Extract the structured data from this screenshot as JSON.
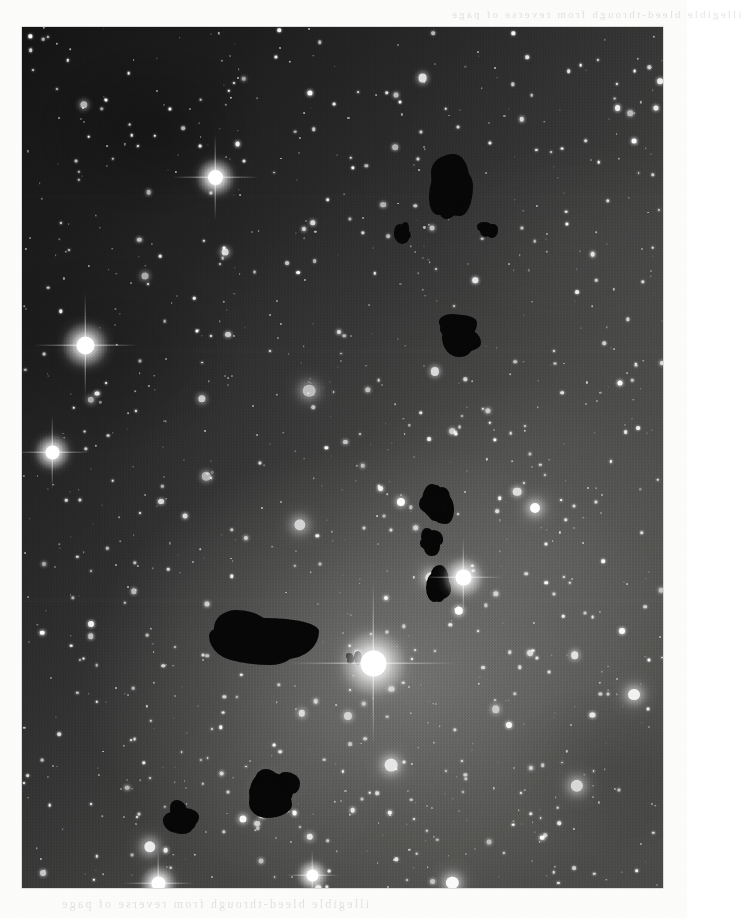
{
  "page": {
    "background_color": "#fcfcfa",
    "kind": "printed-photographic-plate"
  },
  "plate": {
    "name": "star-field-photograph",
    "x": 22,
    "y": 27,
    "width": 641,
    "height": 861,
    "subject": "Dense Milky Way star field with dark nebulae (Bok globules)",
    "sky_dark_color": "#141414",
    "sky_light_color": "#4e4e4c",
    "nebulosity_note": "Diffuse bright nebulosity surrounds the brightest star in the lower-right quadrant; the upper-left quadrant is the darkest part of the field."
  },
  "ghost_text": {
    "bottom": "illegible bleed-through from reverse of page",
    "top": "illegible bleed-through from reverse of page"
  },
  "chart_data": {
    "type": "scatter",
    "xlabel": "",
    "ylabel": "",
    "xlim": [
      0,
      641
    ],
    "ylim": [
      0,
      861
    ],
    "grid": false,
    "legend": null,
    "annotations": [
      "Brightest star with long 4-point diffraction spikes at approx (351, 636) in plate coords",
      "Large dark globule complex at approx (190-280, 585-660)",
      "Chain of small dark globules running vertically near x=415, y=455-575",
      "Dark globule pair in upper right near (430-480, 130-350)"
    ],
    "series": [
      {
        "name": "bright-stars-with-spikes",
        "units": "plate pixels; r = apparent radius",
        "points": [
          {
            "x": 193,
            "y": 150,
            "r": 7.5,
            "spike": 86
          },
          {
            "x": 63,
            "y": 318,
            "r": 9.0,
            "spike": 104
          },
          {
            "x": 30,
            "y": 425,
            "r": 7.0,
            "spike": 74
          },
          {
            "x": 351,
            "y": 636,
            "r": 13.0,
            "spike": 168
          },
          {
            "x": 441,
            "y": 550,
            "r": 8.0,
            "spike": 80
          },
          {
            "x": 136,
            "y": 856,
            "r": 7.0,
            "spike": 70
          },
          {
            "x": 290,
            "y": 848,
            "r": 6.0,
            "spike": 52
          }
        ]
      },
      {
        "name": "dark-globules",
        "units": "plate pixels; bounding boxes",
        "points": [
          {
            "x": 408,
            "y": 128,
            "w": 42,
            "h": 60,
            "label": "upper-right globule A"
          },
          {
            "x": 456,
            "y": 195,
            "w": 18,
            "h": 14,
            "label": "upper-right speck"
          },
          {
            "x": 372,
            "y": 195,
            "w": 16,
            "h": 20,
            "label": "small speck"
          },
          {
            "x": 415,
            "y": 285,
            "w": 45,
            "h": 40,
            "label": "upper-right globule B"
          },
          {
            "x": 398,
            "y": 455,
            "w": 30,
            "h": 36,
            "label": "chain node 1"
          },
          {
            "x": 400,
            "y": 500,
            "w": 22,
            "h": 26,
            "label": "chain node 2"
          },
          {
            "x": 405,
            "y": 540,
            "w": 22,
            "h": 34,
            "label": "chain node 3"
          },
          {
            "x": 190,
            "y": 585,
            "w": 92,
            "h": 72,
            "label": "large globule complex"
          },
          {
            "x": 325,
            "y": 625,
            "w": 14,
            "h": 14,
            "label": "small speck near bright star"
          },
          {
            "x": 230,
            "y": 745,
            "w": 46,
            "h": 40,
            "label": "lower globule"
          },
          {
            "x": 140,
            "y": 775,
            "w": 34,
            "h": 30,
            "label": "lower-left globule"
          }
        ]
      },
      {
        "name": "field-stars",
        "units": "plate pixels",
        "count_approx": 520,
        "note": "Several hundred unresolved point sources distributed across the field; density highest toward the lower half."
      }
    ]
  }
}
